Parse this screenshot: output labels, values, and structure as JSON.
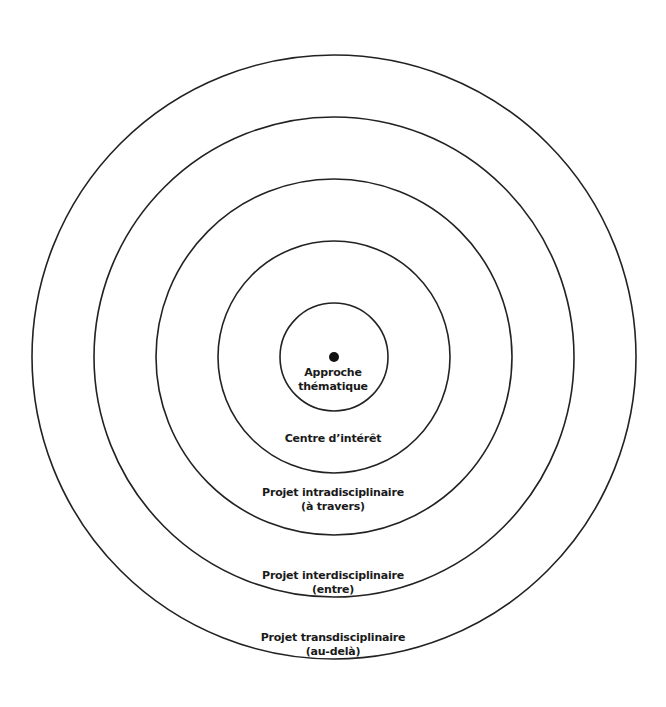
{
  "diagram": {
    "type": "concentric-circles",
    "center": {
      "x": 334,
      "y": 357
    },
    "stroke_color": "#222222",
    "dot_color": "#111111",
    "rings": [
      {
        "radius": 54,
        "line1": "Approche",
        "line2": "thématique"
      },
      {
        "radius": 116,
        "line1": "Centre d’intérêt",
        "line2": ""
      },
      {
        "radius": 178,
        "line1": "Projet intradisciplinaire",
        "line2": "(à travers)"
      },
      {
        "radius": 240,
        "line1": "Projet interdisciplinaire",
        "line2": "(entre)"
      },
      {
        "radius": 302,
        "line1": "Projet transdisciplinaire",
        "line2": "(au-delà)"
      }
    ]
  }
}
